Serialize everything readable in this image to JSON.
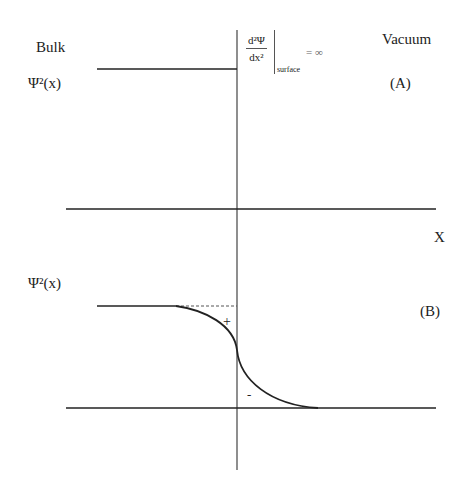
{
  "labels": {
    "bulk": "Bulk",
    "vacuum": "Vacuum",
    "psi_sq_a": "Ψ²(x)",
    "psi_sq_b": "Ψ²(x)",
    "panel_a": "(A)",
    "panel_b": "(B)",
    "x_axis": "X",
    "plus": "+",
    "minus": "-"
  },
  "equation": {
    "numerator": "d²Ψ",
    "denominator": "dx²",
    "subscript": "surface",
    "equals": "= ∞"
  },
  "colors": {
    "line": "#222222",
    "dashed": "#555555"
  }
}
